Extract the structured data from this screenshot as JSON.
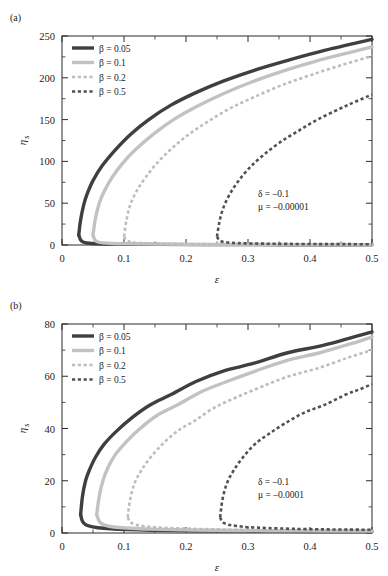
{
  "figure": {
    "background": "#ffffff",
    "panels": [
      {
        "label": "(a)",
        "xlabel": "ε",
        "ylabel": "η",
        "ylabel_sub": "s",
        "xticks": [
          "0",
          "0.1",
          "0.2",
          "0.3",
          "0.4",
          "0.5"
        ],
        "yticks": [
          "0",
          "50",
          "100",
          "150",
          "200",
          "250"
        ],
        "annotation_delta": "δ = –0.1",
        "annotation_mu": "μ = –0.00001",
        "legend": [
          {
            "label": "β = 0.05",
            "color": "#3f3f3f",
            "style": "solid",
            "width": 3.4
          },
          {
            "label": "β = 0.1",
            "color": "#c2c2c2",
            "style": "solid",
            "width": 3.4
          },
          {
            "label": "β = 0.2",
            "color": "#bdbdbd",
            "style": "dotted",
            "width": 2.6
          },
          {
            "label": "β = 0.5",
            "color": "#525252",
            "style": "dotted",
            "width": 2.6
          }
        ]
      },
      {
        "label": "(b)",
        "xlabel": "ε",
        "ylabel": "η",
        "ylabel_sub": "s",
        "xticks": [
          "0",
          "0.1",
          "0.2",
          "0.3",
          "0.4",
          "0.5"
        ],
        "yticks": [
          "0",
          "20",
          "40",
          "60",
          "80"
        ],
        "annotation_delta": "δ = –0.1",
        "annotation_mu": "μ = –0.0001",
        "legend": [
          {
            "label": "β = 0.05",
            "color": "#3f3f3f",
            "style": "solid",
            "width": 3.4
          },
          {
            "label": "β = 0.1",
            "color": "#c2c2c2",
            "style": "solid",
            "width": 3.4
          },
          {
            "label": "β = 0.2",
            "color": "#bdbdbd",
            "style": "dotted",
            "width": 2.6
          },
          {
            "label": "β = 0.5",
            "color": "#525252",
            "style": "dotted",
            "width": 2.6
          }
        ]
      }
    ]
  },
  "chart_data": [
    {
      "type": "line",
      "panel": "(a)",
      "title": "",
      "xlabel": "ε",
      "ylabel": "η_s",
      "xlim": [
        0,
        0.5
      ],
      "ylim": [
        0,
        250
      ],
      "xticks": [
        0,
        0.1,
        0.2,
        0.3,
        0.4,
        0.5
      ],
      "yticks": [
        0,
        50,
        100,
        150,
        200,
        250
      ],
      "grid": false,
      "legend_position": "top-left",
      "annotations": [
        "δ = –0.1",
        "μ = –0.00001"
      ],
      "series": [
        {
          "name": "β = 0.05",
          "color": "#3f3f3f",
          "style": "solid",
          "fold_x": 0.027,
          "upper_branch": {
            "x": [
              0.027,
              0.03,
              0.035,
              0.04,
              0.05,
              0.065,
              0.085,
              0.11,
              0.14,
              0.175,
              0.215,
              0.26,
              0.31,
              0.365,
              0.425,
              0.5
            ],
            "y": [
              12,
              30,
              48,
              60,
              77,
              95,
              113,
              132,
              150,
              167,
              182,
              196,
              209,
              221,
              233,
              246
            ]
          },
          "lower_branch": {
            "x": [
              0.027,
              0.03,
              0.034,
              0.04,
              0.05,
              0.07,
              0.1,
              0.15,
              0.22,
              0.3,
              0.4,
              0.5
            ],
            "y": [
              12,
              6,
              3.5,
              2.4,
              1.7,
              1.2,
              0.9,
              0.7,
              0.5,
              0.4,
              0.35,
              0.3
            ]
          }
        },
        {
          "name": "β = 0.1",
          "color": "#c2c2c2",
          "style": "solid",
          "fold_x": 0.05,
          "upper_branch": {
            "x": [
              0.05,
              0.054,
              0.06,
              0.068,
              0.08,
              0.098,
              0.12,
              0.148,
              0.18,
              0.218,
              0.26,
              0.306,
              0.356,
              0.41,
              0.468,
              0.5
            ],
            "y": [
              12,
              32,
              50,
              64,
              80,
              98,
              115,
              133,
              150,
              166,
              181,
              195,
              208,
              220,
              231,
              237
            ]
          },
          "lower_branch": {
            "x": [
              0.05,
              0.053,
              0.058,
              0.066,
              0.08,
              0.105,
              0.145,
              0.2,
              0.27,
              0.35,
              0.43,
              0.5
            ],
            "y": [
              12,
              6,
              3.6,
              2.5,
              1.8,
              1.3,
              1.0,
              0.8,
              0.6,
              0.5,
              0.42,
              0.38
            ]
          }
        },
        {
          "name": "β = 0.2",
          "color": "#bdbdbd",
          "style": "dotted",
          "fold_x": 0.1,
          "upper_branch": {
            "x": [
              0.1,
              0.104,
              0.11,
              0.12,
              0.134,
              0.152,
              0.175,
              0.202,
              0.234,
              0.27,
              0.31,
              0.354,
              0.4,
              0.45,
              0.5
            ],
            "y": [
              10,
              30,
              48,
              64,
              80,
              97,
              114,
              131,
              147,
              163,
              177,
              191,
              203,
              215,
              226
            ]
          },
          "lower_branch": {
            "x": [
              0.1,
              0.104,
              0.112,
              0.125,
              0.145,
              0.175,
              0.215,
              0.265,
              0.325,
              0.395,
              0.45,
              0.5
            ],
            "y": [
              10,
              5.5,
              3.4,
              2.4,
              1.8,
              1.4,
              1.1,
              0.9,
              0.7,
              0.6,
              0.55,
              0.5
            ]
          }
        },
        {
          "name": "β = 0.5",
          "color": "#525252",
          "style": "dotted",
          "fold_x": 0.25,
          "upper_branch": {
            "x": [
              0.25,
              0.254,
              0.26,
              0.27,
              0.284,
              0.302,
              0.324,
              0.35,
              0.38,
              0.412,
              0.448,
              0.472,
              0.5
            ],
            "y": [
              10,
              28,
              44,
              60,
              76,
              92,
              107,
              122,
              136,
              150,
              163,
              171,
              180
            ]
          },
          "lower_branch": {
            "x": [
              0.25,
              0.254,
              0.262,
              0.275,
              0.295,
              0.325,
              0.365,
              0.415,
              0.46,
              0.5
            ],
            "y": [
              10,
              5.5,
              3.5,
              2.6,
              2.0,
              1.6,
              1.3,
              1.1,
              1.0,
              0.95
            ]
          }
        }
      ]
    },
    {
      "type": "line",
      "panel": "(b)",
      "title": "",
      "xlabel": "ε",
      "ylabel": "η_s",
      "xlim": [
        0,
        0.5
      ],
      "ylim": [
        0,
        80
      ],
      "xticks": [
        0,
        0.1,
        0.2,
        0.3,
        0.4,
        0.5
      ],
      "yticks": [
        0,
        20,
        40,
        60,
        80
      ],
      "grid": false,
      "legend_position": "top-left",
      "annotations": [
        "δ = –0.1",
        "μ = –0.0001"
      ],
      "series": [
        {
          "name": "β = 0.05",
          "color": "#3f3f3f",
          "style": "solid",
          "fold_x": 0.03,
          "upper_branch": {
            "x": [
              0.03,
              0.033,
              0.038,
              0.044,
              0.054,
              0.068,
              0.088,
              0.112,
              0.142,
              0.176,
              0.216,
              0.26,
              0.31,
              0.364,
              0.424,
              0.5
            ],
            "y": [
              7,
              14,
              20,
              24,
              29,
              34,
              39,
              44,
              49,
              53,
              58,
              62,
              65,
              69,
              72,
              77
            ]
          },
          "lower_branch": {
            "x": [
              0.03,
              0.033,
              0.038,
              0.046,
              0.058,
              0.078,
              0.108,
              0.155,
              0.22,
              0.3,
              0.4,
              0.5
            ],
            "y": [
              7,
              4.5,
              3.2,
              2.5,
              2.0,
              1.6,
              1.3,
              1.0,
              0.8,
              0.7,
              0.6,
              0.55
            ]
          }
        },
        {
          "name": "β = 0.1",
          "color": "#c2c2c2",
          "style": "solid",
          "fold_x": 0.056,
          "upper_branch": {
            "x": [
              0.056,
              0.06,
              0.066,
              0.074,
              0.086,
              0.104,
              0.126,
              0.153,
              0.186,
              0.224,
              0.266,
              0.312,
              0.362,
              0.416,
              0.474,
              0.5
            ],
            "y": [
              7,
              14,
              20,
              25,
              30,
              35,
              40,
              45,
              49,
              54,
              58,
              62,
              66,
              69,
              73,
              75
            ]
          },
          "lower_branch": {
            "x": [
              0.056,
              0.06,
              0.066,
              0.076,
              0.092,
              0.118,
              0.158,
              0.212,
              0.28,
              0.36,
              0.44,
              0.5
            ],
            "y": [
              7,
              4.5,
              3.3,
              2.6,
              2.1,
              1.7,
              1.4,
              1.15,
              0.95,
              0.85,
              0.78,
              0.72
            ]
          }
        },
        {
          "name": "β = 0.2",
          "color": "#bdbdbd",
          "style": "dotted",
          "fold_x": 0.106,
          "upper_branch": {
            "x": [
              0.106,
              0.11,
              0.117,
              0.128,
              0.143,
              0.162,
              0.186,
              0.214,
              0.246,
              0.282,
              0.322,
              0.366,
              0.412,
              0.46,
              0.5
            ],
            "y": [
              6,
              13,
              19,
              24,
              29,
              34,
              39,
              43,
              48,
              52,
              56,
              60,
              63,
              67,
              70
            ]
          },
          "lower_branch": {
            "x": [
              0.106,
              0.11,
              0.119,
              0.133,
              0.154,
              0.185,
              0.226,
              0.276,
              0.336,
              0.404,
              0.455,
              0.5
            ],
            "y": [
              6,
              4.2,
              3.2,
              2.6,
              2.1,
              1.8,
              1.5,
              1.25,
              1.05,
              0.95,
              0.88,
              0.85
            ]
          }
        },
        {
          "name": "β = 0.5",
          "color": "#525252",
          "style": "dotted",
          "fold_x": 0.255,
          "upper_branch": {
            "x": [
              0.255,
              0.259,
              0.266,
              0.277,
              0.292,
              0.311,
              0.334,
              0.36,
              0.39,
              0.423,
              0.458,
              0.48,
              0.5
            ],
            "y": [
              6,
              13,
              19,
              24,
              29,
              34,
              38,
              42,
              46,
              49,
              53,
              55,
              57
            ]
          },
          "lower_branch": {
            "x": [
              0.255,
              0.259,
              0.268,
              0.282,
              0.302,
              0.332,
              0.372,
              0.42,
              0.465,
              0.5
            ],
            "y": [
              6,
              4.2,
              3.2,
              2.7,
              2.2,
              1.9,
              1.6,
              1.4,
              1.3,
              1.25
            ]
          }
        }
      ]
    }
  ]
}
